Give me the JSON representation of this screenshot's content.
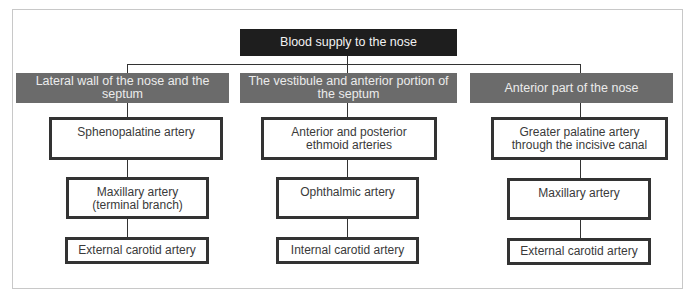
{
  "diagram": {
    "title": "Blood supply to the nose",
    "columns": [
      {
        "category": "Lateral wall of the nose and the septum",
        "nodes": [
          "Sphenopalatine artery",
          "Maxillary artery\n(terminal branch)",
          "External carotid artery"
        ]
      },
      {
        "category": "The vestibule and anterior portion of the septum",
        "nodes": [
          "Anterior and posterior\nethmoid arteries",
          "Ophthalmic artery",
          "Internal carotid artery"
        ]
      },
      {
        "category": "Anterior part of the nose",
        "nodes": [
          "Greater palatine artery\nthrough the incisive canal",
          "Maxillary artery",
          "External carotid artery"
        ]
      }
    ]
  },
  "colors": {
    "root_fill": "#1e1e1e",
    "category_fill": "#6b6b6b",
    "node_border": "#333333",
    "frame_border": "#c8c8c8"
  }
}
